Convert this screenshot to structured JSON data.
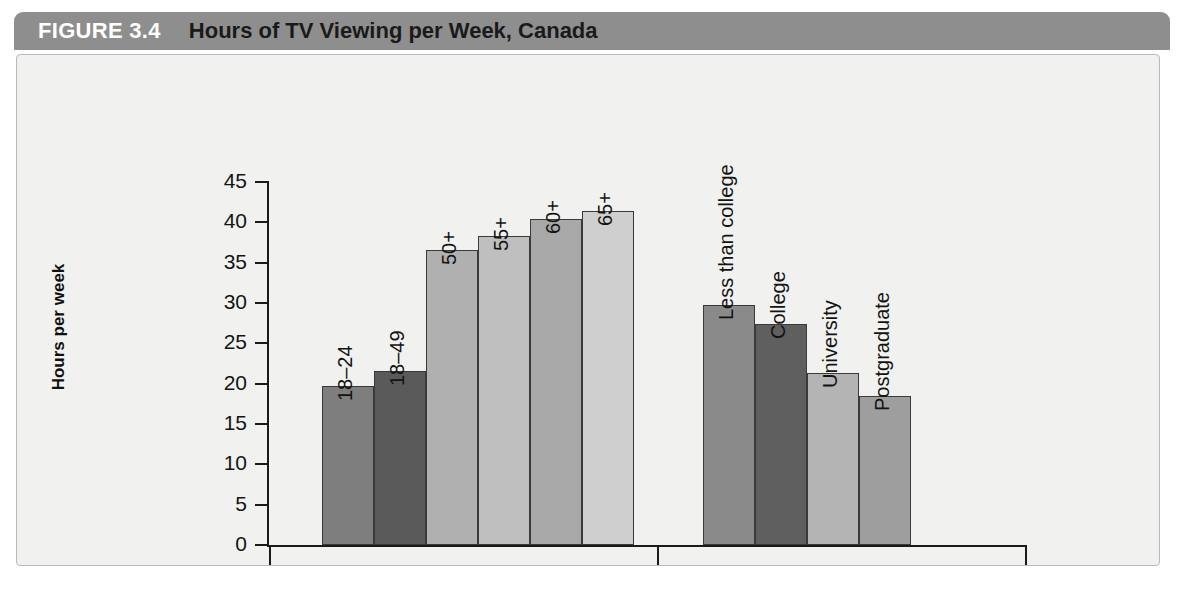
{
  "header": {
    "figure_number": "FIGURE 3.4",
    "title": "Hours of TV Viewing per Week, Canada",
    "bar_color": "#8e8e8e",
    "number_color": "#ffffff",
    "title_color": "#1a1a1a"
  },
  "chart_data": {
    "type": "bar",
    "title": "Hours of TV Viewing per Week, Canada",
    "xlabel": "",
    "ylabel": "Hours per week",
    "ylim": [
      0,
      45
    ],
    "yticks": [
      0,
      5,
      10,
      15,
      20,
      25,
      30,
      35,
      40,
      45
    ],
    "ytick_labels": [
      "0",
      "5",
      "10",
      "15",
      "20",
      "25",
      "30",
      "35",
      "40",
      "45"
    ],
    "grid": false,
    "legend": "none",
    "groups": [
      {
        "name": "Age cohort",
        "categories": [
          "18–24",
          "18–49",
          "50+",
          "55+",
          "60+",
          "65+"
        ],
        "values": [
          19.7,
          21.6,
          36.6,
          38.3,
          40.4,
          41.4
        ],
        "colors": [
          "#7e7e7e",
          "#5a5a5a",
          "#b0b0b0",
          "#bfbfbf",
          "#a8a8a8",
          "#cfcfcf"
        ]
      },
      {
        "name": "Education",
        "categories": [
          "Less than college",
          "College",
          "University",
          "Postgraduate"
        ],
        "values": [
          29.7,
          27.4,
          21.3,
          18.5
        ],
        "colors": [
          "#8a8a8a",
          "#5f5f5f",
          "#b4b4b4",
          "#9e9e9e"
        ]
      }
    ]
  },
  "panel": {
    "background": "#f1f1ef",
    "border_color": "#b9b9b9"
  }
}
